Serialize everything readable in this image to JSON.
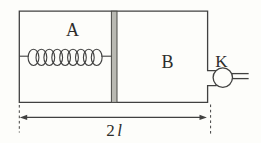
{
  "diagram": {
    "labels": {
      "chamber_a": "A",
      "chamber_b": "B",
      "valve": "K",
      "dimension_value": "2",
      "dimension_symbol": "l"
    },
    "colors": {
      "line": "#414140",
      "piston_fill": "#b9b9b2",
      "background": "#fdfdfa"
    }
  }
}
